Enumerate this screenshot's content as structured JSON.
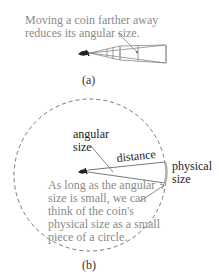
{
  "panel_a": {
    "annotation_line1": "Moving a coin farther away",
    "annotation_line2": "reduces its angular size.",
    "caption": "(a)"
  },
  "panel_b": {
    "angular_size_line1": "angular",
    "angular_size_line2": "size",
    "distance_label": "distance",
    "physical_size_line1": "physical",
    "physical_size_line2": "size",
    "note_lines": [
      "As long as the angular",
      "size is small, we can",
      "think of the coin's",
      "physical size as a small",
      "piece of a circle."
    ],
    "caption": "(b)"
  },
  "colors": {
    "annotation_gray": "#8a8a8a",
    "line": "#555555",
    "coin": "#b0b0b0"
  }
}
